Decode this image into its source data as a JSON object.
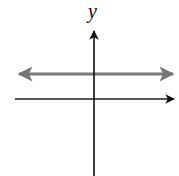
{
  "diagram": {
    "title": "",
    "y_axis": {
      "label": "y",
      "label_position": {
        "x": 94,
        "y": 14
      },
      "x": 94,
      "y_top": 28,
      "y_bottom": 176,
      "arrow": "up",
      "color": "#111111"
    },
    "x_axis": {
      "label": "",
      "y": 99,
      "x_left": 15,
      "x_right": 177,
      "arrow": "right",
      "color": "#222222"
    },
    "horizontal_line": {
      "description": "horizontal line y = c above the x-axis, arrows at both ends",
      "y": 74,
      "x_left": 16,
      "x_right": 176,
      "arrows": "both",
      "color": "#777777"
    }
  }
}
